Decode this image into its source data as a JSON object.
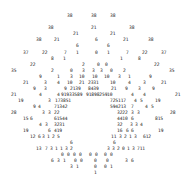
{
  "colors": {
    "text": "#222222",
    "background": "#ffffff"
  },
  "tokens": [
    {
      "t": "38",
      "x": 67,
      "y": 13
    },
    {
      "t": "38",
      "x": 91,
      "y": 13
    },
    {
      "t": "38",
      "x": 110,
      "y": 13
    },
    {
      "t": "38",
      "x": 48,
      "y": 25
    },
    {
      "t": "21",
      "x": 91,
      "y": 25
    },
    {
      "t": "38",
      "x": 129,
      "y": 25
    },
    {
      "t": "21",
      "x": 73,
      "y": 31
    },
    {
      "t": "21",
      "x": 110,
      "y": 31
    },
    {
      "t": "38",
      "x": 36,
      "y": 37
    },
    {
      "t": "21",
      "x": 54,
      "y": 37
    },
    {
      "t": "6",
      "x": 95,
      "y": 37
    },
    {
      "t": "21",
      "x": 123,
      "y": 37
    },
    {
      "t": "38",
      "x": 148,
      "y": 37
    },
    {
      "t": "6",
      "x": 76,
      "y": 43
    },
    {
      "t": "6",
      "x": 107,
      "y": 43
    },
    {
      "t": "37",
      "x": 23,
      "y": 50
    },
    {
      "t": "22",
      "x": 42,
      "y": 50
    },
    {
      "t": "7",
      "x": 64,
      "y": 50
    },
    {
      "t": "1",
      "x": 76,
      "y": 50
    },
    {
      "t": "0",
      "x": 95,
      "y": 50
    },
    {
      "t": "1",
      "x": 107,
      "y": 50
    },
    {
      "t": "7",
      "x": 126,
      "y": 50
    },
    {
      "t": "22",
      "x": 142,
      "y": 50
    },
    {
      "t": "37",
      "x": 161,
      "y": 50
    },
    {
      "t": "8",
      "x": 51,
      "y": 56
    },
    {
      "t": "1",
      "x": 63,
      "y": 56
    },
    {
      "t": "1",
      "x": 120,
      "y": 56
    },
    {
      "t": "8",
      "x": 138,
      "y": 56
    },
    {
      "t": "22",
      "x": 30,
      "y": 62
    },
    {
      "t": "2",
      "x": 82,
      "y": 62
    },
    {
      "t": "0",
      "x": 97,
      "y": 62
    },
    {
      "t": "0",
      "x": 105,
      "y": 62
    },
    {
      "t": "22",
      "x": 154,
      "y": 62
    },
    {
      "t": "35",
      "x": 11,
      "y": 68
    },
    {
      "t": "2",
      "x": 51,
      "y": 68
    },
    {
      "t": "0",
      "x": 70,
      "y": 68
    },
    {
      "t": "3",
      "x": 82,
      "y": 68
    },
    {
      "t": "3",
      "x": 92,
      "y": 68
    },
    {
      "t": "3",
      "x": 100,
      "y": 68
    },
    {
      "t": "0",
      "x": 110,
      "y": 68
    },
    {
      "t": "2",
      "x": 123,
      "y": 68
    },
    {
      "t": "35",
      "x": 169,
      "y": 68
    },
    {
      "t": "9",
      "x": 39,
      "y": 74
    },
    {
      "t": "1",
      "x": 57,
      "y": 74
    },
    {
      "t": "3",
      "x": 70,
      "y": 74
    },
    {
      "t": "10",
      "x": 79,
      "y": 74
    },
    {
      "t": "10",
      "x": 92,
      "y": 74
    },
    {
      "t": "10",
      "x": 104,
      "y": 74
    },
    {
      "t": "3",
      "x": 118,
      "y": 74
    },
    {
      "t": "1",
      "x": 128,
      "y": 74
    },
    {
      "t": "9",
      "x": 149,
      "y": 74
    },
    {
      "t": "21",
      "x": 23,
      "y": 80
    },
    {
      "t": "3",
      "x": 44,
      "y": 80
    },
    {
      "t": "4",
      "x": 57,
      "y": 80
    },
    {
      "t": "10",
      "x": 67,
      "y": 80
    },
    {
      "t": "21",
      "x": 79,
      "y": 80
    },
    {
      "t": "2331",
      "x": 88,
      "y": 80
    },
    {
      "t": "10",
      "x": 110,
      "y": 80
    },
    {
      "t": "4",
      "x": 128,
      "y": 80
    },
    {
      "t": "3",
      "x": 143,
      "y": 80
    },
    {
      "t": "21",
      "x": 161,
      "y": 80
    },
    {
      "t": "9",
      "x": 33,
      "y": 86
    },
    {
      "t": "3",
      "x": 44,
      "y": 86
    },
    {
      "t": "9",
      "x": 64,
      "y": 86
    },
    {
      "t": "2139",
      "x": 70,
      "y": 86
    },
    {
      "t": "8439",
      "x": 88,
      "y": 86
    },
    {
      "t": "21",
      "x": 111,
      "y": 86
    },
    {
      "t": "9",
      "x": 125,
      "y": 86
    },
    {
      "t": "3",
      "x": 138,
      "y": 86
    },
    {
      "t": "9",
      "x": 152,
      "y": 86
    },
    {
      "t": "21",
      "x": 11,
      "y": 92
    },
    {
      "t": "4",
      "x": 39,
      "y": 92
    },
    {
      "t": "4",
      "x": 57,
      "y": 92
    },
    {
      "t": "91933589",
      "x": 61,
      "y": 92
    },
    {
      "t": "91898259",
      "x": 86,
      "y": 92
    },
    {
      "t": "10",
      "x": 107,
      "y": 92
    },
    {
      "t": "4",
      "x": 131,
      "y": 92
    },
    {
      "t": "4",
      "x": 143,
      "y": 92
    },
    {
      "t": "21",
      "x": 175,
      "y": 92
    },
    {
      "t": "19",
      "x": 18,
      "y": 98
    },
    {
      "t": "3",
      "x": 48,
      "y": 98
    },
    {
      "t": "173851",
      "x": 55,
      "y": 98
    },
    {
      "t": "725117",
      "x": 110,
      "y": 98
    },
    {
      "t": "4",
      "x": 134,
      "y": 98
    },
    {
      "t": "5",
      "x": 140,
      "y": 98
    },
    {
      "t": "19",
      "x": 155,
      "y": 98
    },
    {
      "t": "9",
      "x": 33,
      "y": 104
    },
    {
      "t": "4",
      "x": 38,
      "y": 104
    },
    {
      "t": "71342",
      "x": 54,
      "y": 104
    },
    {
      "t": "594213",
      "x": 110,
      "y": 104
    },
    {
      "t": "7",
      "x": 131,
      "y": 104
    },
    {
      "t": "4",
      "x": 145,
      "y": 104
    },
    {
      "t": "5",
      "x": 151,
      "y": 104
    },
    {
      "t": "28",
      "x": 11,
      "y": 110
    },
    {
      "t": "3",
      "x": 42,
      "y": 110
    },
    {
      "t": "3",
      "x": 48,
      "y": 110
    },
    {
      "t": "22",
      "x": 54,
      "y": 110
    },
    {
      "t": "3222",
      "x": 117,
      "y": 110
    },
    {
      "t": "3",
      "x": 131,
      "y": 110
    },
    {
      "t": "3",
      "x": 137,
      "y": 110
    },
    {
      "t": "28",
      "x": 170,
      "y": 110
    },
    {
      "t": "15",
      "x": 23,
      "y": 116
    },
    {
      "t": "6",
      "x": 30,
      "y": 116
    },
    {
      "t": "61544",
      "x": 54,
      "y": 116
    },
    {
      "t": "4410",
      "x": 117,
      "y": 116
    },
    {
      "t": "6",
      "x": 131,
      "y": 116
    },
    {
      "t": "815",
      "x": 155,
      "y": 116
    },
    {
      "t": "4",
      "x": 39,
      "y": 122
    },
    {
      "t": "3",
      "x": 45,
      "y": 122
    },
    {
      "t": "3231",
      "x": 54,
      "y": 122
    },
    {
      "t": "32",
      "x": 117,
      "y": 122
    },
    {
      "t": "3",
      "x": 130,
      "y": 122
    },
    {
      "t": "3",
      "x": 135,
      "y": 122
    },
    {
      "t": "4",
      "x": 140,
      "y": 122
    },
    {
      "t": "19",
      "x": 23,
      "y": 128
    },
    {
      "t": "6",
      "x": 48,
      "y": 128
    },
    {
      "t": "419",
      "x": 54,
      "y": 128
    },
    {
      "t": "16",
      "x": 117,
      "y": 128
    },
    {
      "t": "6",
      "x": 126,
      "y": 128
    },
    {
      "t": "6",
      "x": 131,
      "y": 128
    },
    {
      "t": "19",
      "x": 158,
      "y": 128
    },
    {
      "t": "12",
      "x": 30,
      "y": 134
    },
    {
      "t": "6",
      "x": 38,
      "y": 134
    },
    {
      "t": "3",
      "x": 42,
      "y": 134
    },
    {
      "t": "1",
      "x": 47,
      "y": 134
    },
    {
      "t": "2",
      "x": 52,
      "y": 134
    },
    {
      "t": "5",
      "x": 57,
      "y": 134
    },
    {
      "t": "11",
      "x": 111,
      "y": 134
    },
    {
      "t": "3",
      "x": 119,
      "y": 134
    },
    {
      "t": "2",
      "x": 124,
      "y": 134
    },
    {
      "t": "1",
      "x": 129,
      "y": 134
    },
    {
      "t": "3",
      "x": 134,
      "y": 134
    },
    {
      "t": "612",
      "x": 143,
      "y": 134
    },
    {
      "t": "6",
      "x": 70,
      "y": 140
    },
    {
      "t": "6",
      "x": 113,
      "y": 140
    },
    {
      "t": "13",
      "x": 36,
      "y": 146
    },
    {
      "t": "7",
      "x": 45,
      "y": 146
    },
    {
      "t": "3",
      "x": 50,
      "y": 146
    },
    {
      "t": "1",
      "x": 55,
      "y": 146
    },
    {
      "t": "1",
      "x": 60,
      "y": 146
    },
    {
      "t": "3",
      "x": 65,
      "y": 146
    },
    {
      "t": "2",
      "x": 70,
      "y": 146
    },
    {
      "t": "3",
      "x": 107,
      "y": 146
    },
    {
      "t": "3",
      "x": 112,
      "y": 146
    },
    {
      "t": "2",
      "x": 117,
      "y": 146
    },
    {
      "t": "0",
      "x": 122,
      "y": 146
    },
    {
      "t": "1",
      "x": 127,
      "y": 146
    },
    {
      "t": "3",
      "x": 132,
      "y": 146
    },
    {
      "t": "711",
      "x": 137,
      "y": 146
    },
    {
      "t": "0",
      "x": 61,
      "y": 152
    },
    {
      "t": "0",
      "x": 67,
      "y": 152
    },
    {
      "t": "0",
      "x": 73,
      "y": 152
    },
    {
      "t": "0",
      "x": 79,
      "y": 152
    },
    {
      "t": "0",
      "x": 89,
      "y": 152
    },
    {
      "t": "0",
      "x": 95,
      "y": 152
    },
    {
      "t": "0",
      "x": 104,
      "y": 152
    },
    {
      "t": "0",
      "x": 110,
      "y": 152
    },
    {
      "t": "6",
      "x": 51,
      "y": 158
    },
    {
      "t": "3",
      "x": 57,
      "y": 158
    },
    {
      "t": "1",
      "x": 63,
      "y": 158
    },
    {
      "t": "0",
      "x": 74,
      "y": 158
    },
    {
      "t": "0",
      "x": 80,
      "y": 158
    },
    {
      "t": "0",
      "x": 94,
      "y": 158
    },
    {
      "t": "0",
      "x": 106,
      "y": 158
    },
    {
      "t": "3",
      "x": 125,
      "y": 158
    },
    {
      "t": "6",
      "x": 131,
      "y": 158
    },
    {
      "t": "3",
      "x": 70,
      "y": 164
    },
    {
      "t": "1",
      "x": 76,
      "y": 164
    },
    {
      "t": "0",
      "x": 94,
      "y": 164
    },
    {
      "t": "0",
      "x": 104,
      "y": 164
    },
    {
      "t": "1",
      "x": 110,
      "y": 164
    },
    {
      "t": "1",
      "x": 94,
      "y": 170
    }
  ]
}
